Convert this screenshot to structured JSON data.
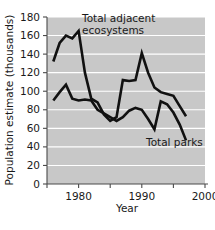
{
  "chart_data": {
    "type": "line",
    "title": "",
    "xlabel": "Year",
    "ylabel": "Population estimate (thousands)",
    "xlim": [
      1975,
      2000
    ],
    "ylim": [
      0,
      180
    ],
    "ytick_step": 20,
    "yticks": [
      0,
      20,
      40,
      60,
      80,
      100,
      120,
      140,
      160,
      180
    ],
    "ytick_labels": [
      "0",
      "20",
      "40",
      "60",
      "80",
      "100",
      "120",
      "140",
      "160",
      "180"
    ],
    "xticks": [
      1975,
      1980,
      1985,
      1990,
      1995,
      2000
    ],
    "xtick_labels": [
      "",
      "1980",
      "",
      "1990",
      "",
      "2000"
    ],
    "grid": "horizontal-white",
    "legend": "inline-annotations",
    "plot_background": "#c8c8c8",
    "line_color": "#111111",
    "series": [
      {
        "name": "Total adjacent ecosystems",
        "label_lines": [
          "Total adjacent",
          "ecosystems"
        ],
        "x": [
          1976,
          1977,
          1978,
          1979,
          1980,
          1981,
          1982,
          1983,
          1984,
          1985,
          1986,
          1987,
          1988,
          1989,
          1990,
          1991,
          1992,
          1993,
          1994,
          1995,
          1996,
          1997
        ],
        "values": [
          132,
          152,
          160,
          157,
          165,
          120,
          92,
          88,
          75,
          68,
          72,
          112,
          111,
          112,
          141,
          120,
          104,
          99,
          97,
          95,
          84,
          73
        ]
      },
      {
        "name": "Total parks",
        "label_lines": [
          "Total parks"
        ],
        "x": [
          1976,
          1977,
          1978,
          1979,
          1980,
          1981,
          1982,
          1983,
          1984,
          1985,
          1986,
          1987,
          1988,
          1989,
          1990,
          1991,
          1992,
          1993,
          1994,
          1995,
          1996,
          1997
        ],
        "values": [
          90,
          99,
          107,
          92,
          90,
          91,
          90,
          80,
          76,
          72,
          68,
          72,
          79,
          82,
          80,
          70,
          59,
          89,
          86,
          77,
          64,
          47
        ]
      }
    ],
    "annotations": [
      {
        "name": "ecosystems-label",
        "text_lines": [
          "Total adjacent",
          "ecosystems"
        ],
        "x_px": 82,
        "y_px": 22
      },
      {
        "name": "parks-label",
        "text_lines": [
          "Total parks"
        ],
        "x_px": 146,
        "y_px": 146
      }
    ]
  }
}
